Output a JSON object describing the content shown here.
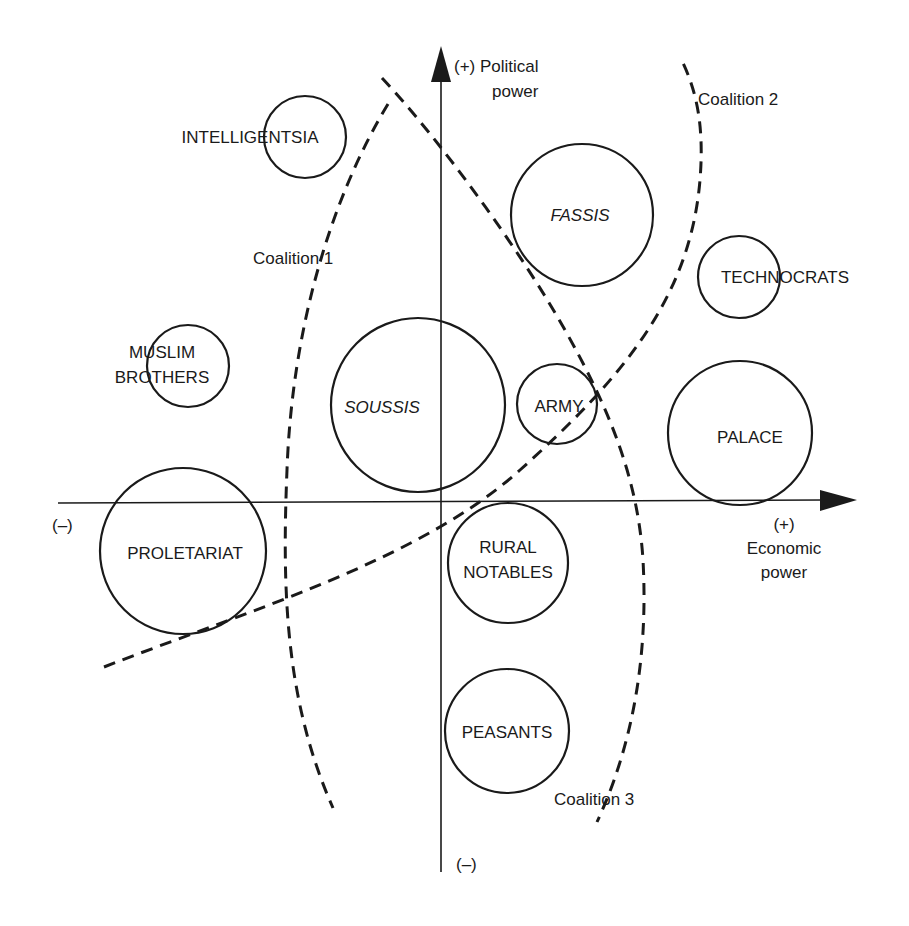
{
  "diagram": {
    "type": "positioning-map",
    "axes": {
      "y": {
        "top_label": "(+) Political",
        "top_label_2": "power",
        "bottom_label": "(–)"
      },
      "x": {
        "left_label": "(–)",
        "right_label_1": "(+)",
        "right_label_2": "Economic",
        "right_label_3": "power"
      }
    },
    "groups": [
      {
        "id": "intelligentsia",
        "label": "INTELLIGENTSIA",
        "italic": false,
        "cx": 305,
        "cy": 137,
        "r": 41
      },
      {
        "id": "fassis",
        "label": "FASSIS",
        "italic": true,
        "cx": 582,
        "cy": 215,
        "r": 71
      },
      {
        "id": "technocrats",
        "label": "TECHNOCRATS",
        "italic": false,
        "cx": 739,
        "cy": 277,
        "r": 41
      },
      {
        "id": "muslim-brothers",
        "label_1": "MUSLIM",
        "label_2": "BROTHERS",
        "italic": false,
        "cx": 188,
        "cy": 366,
        "r": 41
      },
      {
        "id": "soussis",
        "label": "SOUSSIS",
        "italic": true,
        "cx": 418,
        "cy": 405,
        "r": 87
      },
      {
        "id": "army",
        "label": "ARMY",
        "italic": false,
        "cx": 557,
        "cy": 404,
        "r": 40
      },
      {
        "id": "palace",
        "label": "PALACE",
        "italic": false,
        "cx": 740,
        "cy": 433,
        "r": 72
      },
      {
        "id": "proletariat",
        "label": "PROLETARIAT",
        "italic": false,
        "cx": 183,
        "cy": 551,
        "r": 83
      },
      {
        "id": "rural-notables",
        "label_1": "RURAL",
        "label_2": "NOTABLES",
        "italic": false,
        "cx": 508,
        "cy": 563,
        "r": 60
      },
      {
        "id": "peasants",
        "label": "PEASANTS",
        "italic": false,
        "cx": 507,
        "cy": 731,
        "r": 62
      }
    ],
    "coalitions": [
      {
        "id": "coalition-1",
        "label": "Coalition 1"
      },
      {
        "id": "coalition-2",
        "label": "Coalition 2"
      },
      {
        "id": "coalition-3",
        "label": "Coalition 3"
      }
    ],
    "colors": {
      "ink": "#1a1a1a",
      "background": "#ffffff"
    }
  }
}
